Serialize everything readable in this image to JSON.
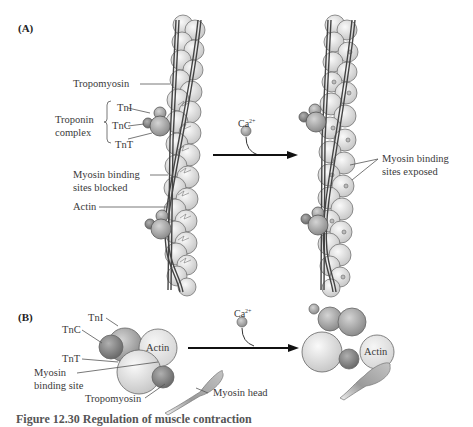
{
  "panel_a": {
    "label": "(A)",
    "left_labels": {
      "tropomyosin": "Tropomyosin",
      "troponin_complex": "Troponin\ncomplex",
      "troponin_line1": "Troponin",
      "troponin_line2": "complex",
      "tni": "TnI",
      "tnc": "TnC",
      "tnt": "TnT",
      "blocked_line1": "Myosin binding",
      "blocked_line2": "sites blocked",
      "actin": "Actin"
    },
    "calcium": "Ca",
    "calcium_charge": "2+",
    "right_labels": {
      "exposed_line1": "Myosin binding",
      "exposed_line2": "sites exposed"
    }
  },
  "panel_b": {
    "label": "(B)",
    "left_labels": {
      "tni": "TnI",
      "tnc": "TnC",
      "tnt": "TnT",
      "binding_line1": "Myosin",
      "binding_line2": "binding site",
      "tropomyosin": "Tropomyosin",
      "actin": "Actin",
      "myosin_head": "Myosin head"
    },
    "calcium": "Ca",
    "calcium_charge": "2+",
    "right_labels": {
      "actin": "Actin"
    }
  },
  "caption": "Figure 12.30 Regulation of muscle contraction",
  "colors": {
    "actin_fill": "#e6e6e6",
    "troponin_dark": "#8a8a8a",
    "troponin_mid": "#b0b0b0",
    "stroke": "#555555",
    "arrow": "#111111"
  }
}
